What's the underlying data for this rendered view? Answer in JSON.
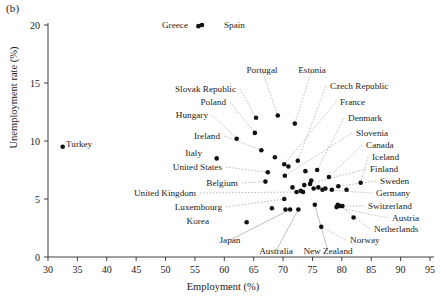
{
  "figure": {
    "panel_label": "(b)",
    "xlabel": "Employment (%)",
    "ylabel": "Unemployment rate (%)"
  },
  "chart_data": {
    "type": "scatter",
    "title": "",
    "xlabel": "Employment (%)",
    "ylabel": "Unemployment rate (%)",
    "xlim": [
      30,
      95
    ],
    "ylim": [
      0,
      20
    ],
    "xticks": [
      30,
      35,
      40,
      45,
      50,
      55,
      60,
      65,
      70,
      75,
      80,
      85,
      90,
      95
    ],
    "yticks": [
      0,
      5,
      10,
      15,
      20
    ],
    "grid": false,
    "legend": "none",
    "point_labels_shown": true,
    "points": [
      {
        "label": "Turkey",
        "x": 32.5,
        "y": 9.5,
        "lx": 66,
        "ly": 147,
        "anchor": "start",
        "leader": "none"
      },
      {
        "label": "Greece",
        "x": 55.6,
        "y": 19.9,
        "lx": 188,
        "ly": 28,
        "anchor": "end",
        "leader": "none"
      },
      {
        "label": "Spain",
        "x": 56.2,
        "y": 20.0,
        "lx": 224,
        "ly": 28,
        "anchor": "start",
        "leader": "none"
      },
      {
        "label": "Slovak Republic",
        "x": 65.4,
        "y": 12.0,
        "lx": 236,
        "ly": 92,
        "anchor": "end",
        "leader": "dashed"
      },
      {
        "label": "Poland",
        "x": 65.2,
        "y": 10.7,
        "lx": 226,
        "ly": 105,
        "anchor": "end",
        "leader": "dashed"
      },
      {
        "label": "Portugal",
        "x": 69.1,
        "y": 12.2,
        "lx": 262,
        "ly": 73,
        "anchor": "middle",
        "leader": "dashed"
      },
      {
        "label": "Estonia",
        "x": 72.0,
        "y": 11.5,
        "lx": 312,
        "ly": 73,
        "anchor": "middle",
        "leader": "dashed"
      },
      {
        "label": "Hungary",
        "x": 62.1,
        "y": 10.2,
        "lx": 208,
        "ly": 118,
        "anchor": "end",
        "leader": "dashed"
      },
      {
        "label": "Ireland",
        "x": 66.3,
        "y": 9.2,
        "lx": 220,
        "ly": 139,
        "anchor": "end",
        "leader": "dashed"
      },
      {
        "label": "Italy",
        "x": 58.7,
        "y": 8.5,
        "lx": 202,
        "ly": 156,
        "anchor": "end",
        "leader": "none"
      },
      {
        "label": "Czech Republic",
        "x": 72.5,
        "y": 8.3,
        "lx": 330,
        "ly": 89,
        "anchor": "start",
        "leader": "dashed"
      },
      {
        "label": "France",
        "x": 70.2,
        "y": 8.0,
        "lx": 340,
        "ly": 105,
        "anchor": "start",
        "leader": "dashed"
      },
      {
        "label": "Denmark",
        "x": 75.8,
        "y": 7.5,
        "lx": 348,
        "ly": 121,
        "anchor": "start",
        "leader": "dashed"
      },
      {
        "label": "Slovenia",
        "x": 70.3,
        "y": 7.0,
        "lx": 356,
        "ly": 136,
        "anchor": "start",
        "leader": "dashed"
      },
      {
        "label": "Canada",
        "x": 77.8,
        "y": 6.9,
        "lx": 366,
        "ly": 148,
        "anchor": "start",
        "leader": "dashed"
      },
      {
        "label": "United States",
        "x": 67.4,
        "y": 7.3,
        "lx": 222,
        "ly": 170,
        "anchor": "end",
        "leader": "dashed"
      },
      {
        "label": "Iceland",
        "x": 83.2,
        "y": 6.4,
        "lx": 372,
        "ly": 160,
        "anchor": "start",
        "leader": "dashed"
      },
      {
        "label": "Belgium",
        "x": 67.0,
        "y": 6.5,
        "lx": 238,
        "ly": 186,
        "anchor": "end",
        "leader": "dashed"
      },
      {
        "label": "Finland",
        "x": 73.6,
        "y": 6.2,
        "lx": 370,
        "ly": 172,
        "anchor": "start",
        "leader": "dashed"
      },
      {
        "label": "Sweden",
        "x": 79.4,
        "y": 6.1,
        "lx": 380,
        "ly": 184,
        "anchor": "start",
        "leader": "dashed"
      },
      {
        "label": "United Kingdom",
        "x": 72.3,
        "y": 5.6,
        "lx": 196,
        "ly": 196,
        "anchor": "end",
        "leader": "dashed"
      },
      {
        "label": "Germany",
        "x": 76.7,
        "y": 5.8,
        "lx": 376,
        "ly": 196,
        "anchor": "start",
        "leader": "dashed"
      },
      {
        "label": "Luxembourg",
        "x": 70.2,
        "y": 5.0,
        "lx": 222,
        "ly": 210,
        "anchor": "end",
        "leader": "dashed"
      },
      {
        "label": "Switzerland",
        "x": 80.1,
        "y": 4.4,
        "lx": 368,
        "ly": 209,
        "anchor": "start",
        "leader": "dashed"
      },
      {
        "label": "Austria",
        "x": 79.1,
        "y": 4.3,
        "lx": 392,
        "ly": 221,
        "anchor": "start",
        "leader": "dashed"
      },
      {
        "label": "Korea",
        "x": 63.8,
        "y": 3.0,
        "lx": 209,
        "ly": 224,
        "anchor": "end",
        "leader": "none"
      },
      {
        "label": "Netherlands",
        "x": 79.7,
        "y": 4.4,
        "lx": 374,
        "ly": 232,
        "anchor": "start",
        "leader": "dashed"
      },
      {
        "label": "Japan",
        "x": 71.2,
        "y": 4.1,
        "lx": 230,
        "ly": 243,
        "anchor": "middle",
        "leader": "solid"
      },
      {
        "label": "Australia",
        "x": 72.6,
        "y": 4.1,
        "lx": 276,
        "ly": 254,
        "anchor": "middle",
        "leader": "solid"
      },
      {
        "label": "New Zealand",
        "x": 75.4,
        "y": 4.5,
        "lx": 328,
        "ly": 254,
        "anchor": "middle",
        "leader": "solid"
      },
      {
        "label": "Norway",
        "x": 76.5,
        "y": 2.6,
        "lx": 350,
        "ly": 243,
        "anchor": "start",
        "leader": "dashed"
      }
    ],
    "unlabeled_points": [
      {
        "x": 68.6,
        "y": 8.6
      },
      {
        "x": 70.9,
        "y": 7.8
      },
      {
        "x": 73.8,
        "y": 7.4
      },
      {
        "x": 74.6,
        "y": 6.3
      },
      {
        "x": 75.2,
        "y": 5.9
      },
      {
        "x": 77.2,
        "y": 5.9
      },
      {
        "x": 78.3,
        "y": 5.8
      },
      {
        "x": 74.8,
        "y": 6.6
      },
      {
        "x": 71.6,
        "y": 6.0
      },
      {
        "x": 73.0,
        "y": 5.7
      },
      {
        "x": 73.4,
        "y": 5.6
      },
      {
        "x": 76.0,
        "y": 6.0
      },
      {
        "x": 80.8,
        "y": 5.8
      },
      {
        "x": 79.3,
        "y": 4.5
      },
      {
        "x": 79.6,
        "y": 4.4
      },
      {
        "x": 82.0,
        "y": 3.4
      },
      {
        "x": 68.1,
        "y": 4.2
      },
      {
        "x": 70.4,
        "y": 4.1
      }
    ]
  }
}
